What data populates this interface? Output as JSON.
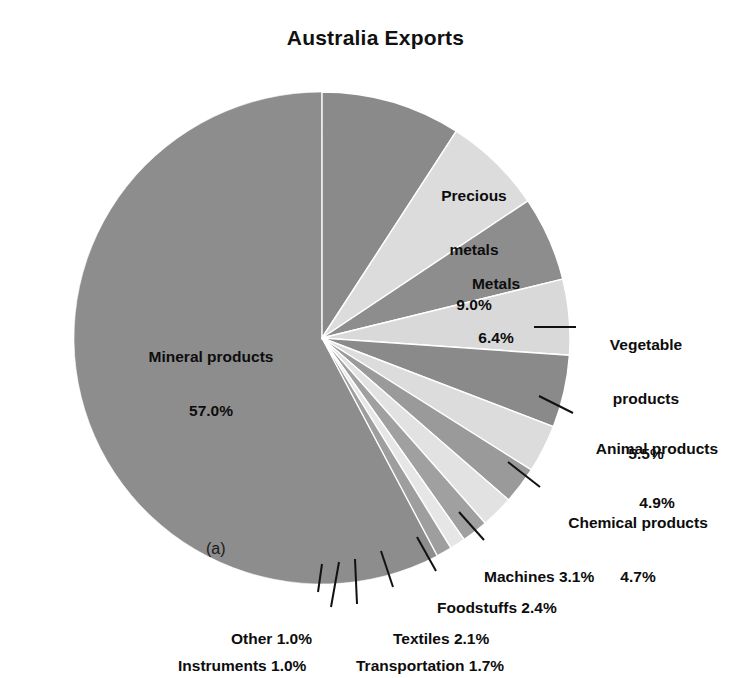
{
  "chart_data": {
    "type": "pie",
    "title": "Australia Exports",
    "figure_tag": "(a)",
    "xlabel": "",
    "ylabel": "",
    "legend_position": "none",
    "grid": false,
    "units": "percent",
    "categories": [
      "Mineral products",
      "Precious metals",
      "Metals",
      "Vegetable products",
      "Animal products",
      "Chemical products",
      "Machines",
      "Foodstuffs",
      "Textiles",
      "Transportation",
      "Instruments",
      "Other"
    ],
    "values": [
      57.0,
      9.0,
      6.4,
      5.5,
      4.9,
      4.7,
      3.1,
      2.4,
      2.1,
      1.7,
      1.0,
      1.0
    ],
    "value_labels": [
      "57.0%",
      "9.0%",
      "6.4%",
      "5.5%",
      "4.9%",
      "4.7%",
      "3.1%",
      "2.4%",
      "2.1%",
      "1.7%",
      "1.0%",
      "1.0%"
    ],
    "slice_colors": [
      "#8d8d8d",
      "#8a8a8a",
      "#dcdcdc",
      "#8d8d8d",
      "#d9d9d9",
      "#8a8a8a",
      "#dcdcdc",
      "#9a9a9a",
      "#e2e2e2",
      "#a0a0a0",
      "#e6e6e6",
      "#9e9e9e"
    ]
  },
  "labels": {
    "inside": [
      {
        "name": "mineral-products",
        "line1": "Mineral products",
        "line2": "57.0%"
      },
      {
        "name": "precious-metals",
        "line1": "Precious",
        "line2": "metals",
        "line3": "9.0%"
      },
      {
        "name": "metals",
        "line1": "Metals",
        "line2": "6.4%"
      }
    ],
    "outside": [
      {
        "name": "vegetable-products",
        "line1": "Vegetable",
        "line2": "products",
        "line3": "5.5%"
      },
      {
        "name": "animal-products",
        "line1": "Animal products",
        "line2": "4.9%"
      },
      {
        "name": "chemical-products",
        "line1": "Chemical products",
        "line2": "4.7%"
      },
      {
        "name": "machines",
        "line1": "Machines 3.1%"
      },
      {
        "name": "foodstuffs",
        "line1": "Foodstuffs 2.4%"
      },
      {
        "name": "textiles",
        "line1": "Textiles 2.1%"
      },
      {
        "name": "transportation",
        "line1": "Transportation 1.7%"
      },
      {
        "name": "instruments",
        "line1": "Instruments 1.0%"
      },
      {
        "name": "other",
        "line1": "Other 1.0%"
      }
    ]
  }
}
